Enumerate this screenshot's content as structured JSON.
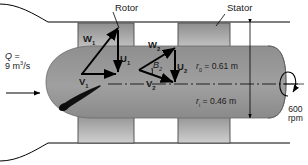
{
  "figure": {
    "type": "engineering-diagram"
  },
  "callouts": {
    "rotor": "Rotor",
    "stator": "Stator"
  },
  "flow": {
    "symbol": "Q",
    "equals": "=",
    "value": "9",
    "unit_base": "m",
    "unit_exp": "3",
    "unit_per": "/s",
    "label_line1": "Q =",
    "label_line2": "9 m3/s"
  },
  "radii": {
    "outer": {
      "symbol": "r",
      "sub": "0",
      "equals": "=",
      "value": "0.61",
      "unit": "m",
      "text": "r0 = 0.61 m"
    },
    "inner": {
      "symbol": "r",
      "sub": "i",
      "equals": "=",
      "value": "0.46",
      "unit": "m",
      "text": "ri = 0.46 m"
    }
  },
  "rotation": {
    "speed": "600",
    "unit": "rpm"
  },
  "velocity_triangles": [
    {
      "station": 1,
      "vectors": [
        {
          "name": "W",
          "sub": "1",
          "label": "W1"
        },
        {
          "name": "U",
          "sub": "1",
          "label": "U1"
        },
        {
          "name": "V",
          "sub": "1",
          "label": "V1"
        }
      ]
    },
    {
      "station": 2,
      "vectors": [
        {
          "name": "W",
          "sub": "2",
          "label": "W2"
        },
        {
          "name": "U",
          "sub": "2",
          "label": "U2"
        },
        {
          "name": "V",
          "sub": "2",
          "label": "V2"
        }
      ],
      "angle": {
        "name": "B",
        "sub": "2",
        "label": "B2"
      }
    }
  ],
  "colors": {
    "duct_wall": "#000000",
    "hub_fill": "#9a9a9a",
    "blade_fill": "#b5b5b5",
    "blade_stroke": "#3a3a3a",
    "vector_stroke": "#000000",
    "vane_fill": "#101010",
    "background": "#ffffff",
    "text": "#1a1a1a"
  }
}
